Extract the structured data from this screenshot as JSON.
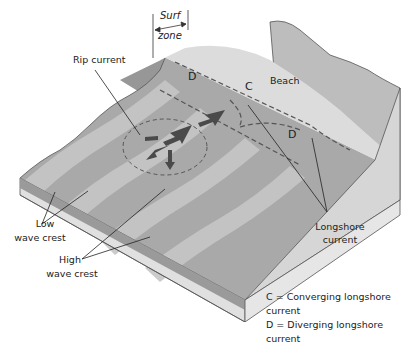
{
  "diagram": {
    "labels": {
      "surf_zone_line1": "Surf",
      "surf_zone_line2": "zone",
      "rip_current": "Rip current",
      "beach": "Beach",
      "low_wave_crest_line1": "Low",
      "low_wave_crest_line2": "wave crest",
      "high_wave_crest_line1": "High",
      "high_wave_crest_line2": "wave crest",
      "longshore_current_line1": "Longshore",
      "longshore_current_line2": "current"
    },
    "markers": {
      "d_upper": "D",
      "c": "C",
      "d_lower": "D"
    },
    "legend": [
      {
        "key": "C",
        "text": "C = Converging longshore current"
      },
      {
        "key": "D",
        "text": "D = Diverging longshore current"
      }
    ],
    "colors": {
      "water_dark": "#8a8a8a",
      "water_mid": "#a8a8a8",
      "water_light": "#c8c8c8",
      "beach": "#dcdcdc",
      "land": "#b8b8b8",
      "side_face": "#e2e2e2",
      "arrow": "#4a4a4a"
    }
  }
}
